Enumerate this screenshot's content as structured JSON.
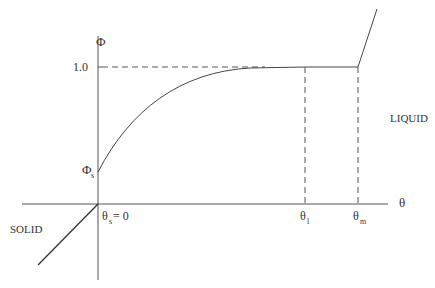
{
  "diagram": {
    "y_axis_label": "Φ",
    "y_tick_label": "1.0",
    "phi_s_label": "Φ",
    "phi_s_sub": "s",
    "x_axis_label": "θ",
    "theta_s_label": "θ",
    "theta_s_sub": "s",
    "theta_s_eq": " = 0",
    "theta_l_label": "θ",
    "theta_l_sub": "l",
    "theta_m_label": "θ",
    "theta_m_sub": "m",
    "region_liquid": "LIQUID",
    "region_solid": "SOLID"
  },
  "colors": {
    "line": "#444444",
    "text": "#333333",
    "background": "#ffffff"
  }
}
